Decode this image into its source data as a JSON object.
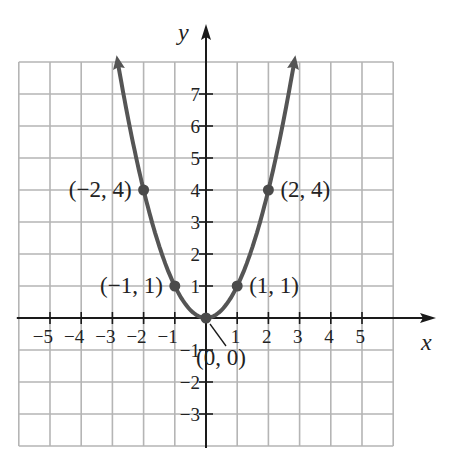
{
  "chart_data": {
    "type": "line",
    "title": "",
    "function": "y = x^2",
    "xlabel": "x",
    "ylabel": "y",
    "xlim": [
      -6,
      6
    ],
    "ylim": [
      -4,
      8
    ],
    "grid": true,
    "x_ticks": [
      -5,
      -4,
      -3,
      -2,
      -1,
      1,
      2,
      3,
      4,
      5
    ],
    "x_tick_labels": [
      "−5",
      "−4",
      "−3",
      "−2",
      "−1",
      "1",
      "2",
      "3",
      "4",
      "5"
    ],
    "y_ticks": [
      7,
      6,
      5,
      4,
      3,
      2,
      1,
      -1,
      -2,
      -3
    ],
    "y_tick_labels": [
      "7",
      "6",
      "5",
      "4",
      "3",
      "2",
      "1",
      "−1",
      "−2",
      "−3"
    ],
    "series": [
      {
        "name": "y = x^2",
        "x": [
          -2.8,
          -2,
          -1,
          0,
          1,
          2,
          2.8
        ],
        "values": [
          7.84,
          4,
          1,
          0,
          1,
          4,
          7.84
        ],
        "color": "#555555"
      }
    ],
    "points": [
      {
        "x": -2,
        "y": 4,
        "label": "(−2, 4)"
      },
      {
        "x": -1,
        "y": 1,
        "label": "(−1, 1)"
      },
      {
        "x": 0,
        "y": 0,
        "label": "(0, 0)"
      },
      {
        "x": 1,
        "y": 1,
        "label": "(1, 1)"
      },
      {
        "x": 2,
        "y": 4,
        "label": "(2, 4)"
      }
    ]
  },
  "colors": {
    "grid": "#b5b5b5",
    "axis": "#1a1a1a",
    "curve": "#555555",
    "point": "#4a4a4a",
    "text": "#222222"
  }
}
